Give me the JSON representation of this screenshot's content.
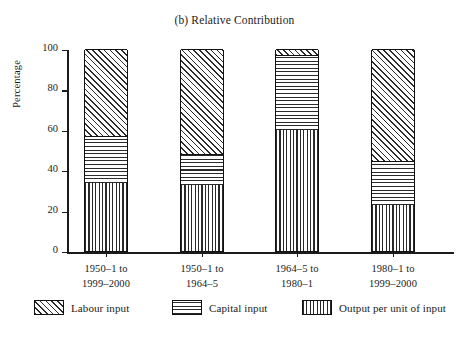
{
  "chart_data": {
    "type": "bar",
    "subtype": "stacked-100-percent",
    "title": "(b) Relative Contribution",
    "xlabel": "",
    "ylabel": "Percentage",
    "ylim": [
      0,
      100
    ],
    "yticks": [
      0,
      20,
      40,
      60,
      80,
      100
    ],
    "ytick_labels": [
      "0",
      "20",
      "40",
      "60",
      "80",
      "100"
    ],
    "grid": false,
    "legend_position": "bottom",
    "categories": [
      "1950–1 to 1999–2000",
      "1950–1 to 1964–5",
      "1964–5 to 1980–1",
      "1980–1 to 1999–2000"
    ],
    "category_lines": [
      [
        "1950–1 to",
        "1999–2000"
      ],
      [
        "1950–1 to",
        "1964–5"
      ],
      [
        "1964–5 to",
        "1980–1"
      ],
      [
        "1980–1 to",
        "1999–2000"
      ]
    ],
    "series": [
      {
        "name": "Output per unit of input",
        "pattern": "vertical",
        "values": [
          34,
          33,
          60,
          23
        ]
      },
      {
        "name": "Capital input",
        "pattern": "horizontal",
        "values": [
          23,
          15,
          37,
          22
        ]
      },
      {
        "name": "Labour input",
        "pattern": "diagonal",
        "values": [
          43,
          52,
          3,
          55
        ]
      }
    ],
    "stack_order_bottom_to_top": [
      "Output per unit of input",
      "Capital input",
      "Labour input"
    ],
    "colors": {
      "ink": "#1b1b1b",
      "hatch": "#2a2a2a",
      "background": "#ffffff"
    }
  },
  "legend": {
    "items": [
      {
        "label": "Labour input",
        "pattern": "diagonal"
      },
      {
        "label": "Capital input",
        "pattern": "horizontal"
      },
      {
        "label": "Output per unit of input",
        "pattern": "vertical"
      }
    ]
  }
}
